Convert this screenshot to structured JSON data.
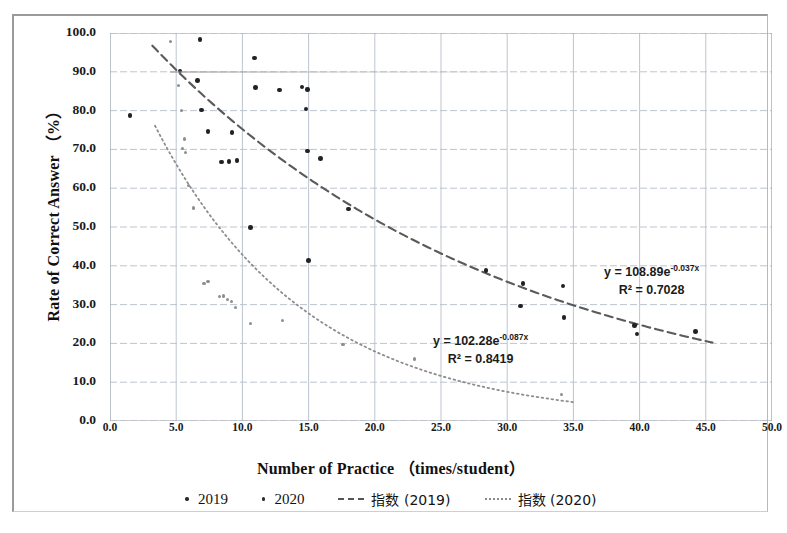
{
  "chart_data": {
    "type": "scatter",
    "title": "",
    "xlabel": "Number of Practice （times/student）",
    "ylabel": "Rate of Correct Answer （%）",
    "xlim": [
      0.0,
      50.0
    ],
    "ylim": [
      0.0,
      100.0
    ],
    "xticks": [
      "0.0",
      "5.0",
      "10.0",
      "15.0",
      "20.0",
      "25.0",
      "30.0",
      "35.0",
      "40.0",
      "45.0",
      "50.0"
    ],
    "yticks": [
      "0.0",
      "10.0",
      "20.0",
      "30.0",
      "40.0",
      "50.0",
      "60.0",
      "70.0",
      "80.0",
      "90.0",
      "100.0"
    ],
    "grid": true,
    "legend_position": "bottom",
    "series": [
      {
        "name": "2019",
        "marker": "small-dot",
        "color": "#222222",
        "points": [
          [
            1.5,
            78.8
          ],
          [
            5.3,
            90.2
          ],
          [
            6.8,
            98.3
          ],
          [
            6.6,
            87.8
          ],
          [
            6.9,
            80.2
          ],
          [
            7.4,
            74.6
          ],
          [
            8.4,
            66.8
          ],
          [
            9.0,
            66.9
          ],
          [
            9.2,
            74.3
          ],
          [
            9.6,
            67.1
          ],
          [
            10.6,
            49.8
          ],
          [
            10.9,
            93.6
          ],
          [
            11.0,
            85.9
          ],
          [
            12.8,
            85.3
          ],
          [
            14.5,
            86.1
          ],
          [
            14.9,
            85.5
          ],
          [
            14.8,
            80.4
          ],
          [
            14.9,
            69.6
          ],
          [
            15.0,
            41.4
          ],
          [
            15.9,
            67.6
          ],
          [
            18.0,
            54.6
          ],
          [
            28.4,
            38.8
          ],
          [
            31.2,
            35.4
          ],
          [
            31.0,
            29.6
          ],
          [
            34.2,
            34.8
          ],
          [
            34.3,
            26.6
          ],
          [
            39.6,
            24.6
          ],
          [
            39.8,
            22.4
          ],
          [
            44.2,
            23.0
          ]
        ]
      },
      {
        "name": "2020",
        "marker": "tiny-dot",
        "color": "#8e8e8e",
        "points": [
          [
            4.6,
            97.8
          ],
          [
            5.2,
            86.4
          ],
          [
            5.4,
            80.1
          ],
          [
            5.6,
            72.7
          ],
          [
            5.5,
            70.2
          ],
          [
            5.7,
            69.3
          ],
          [
            5.9,
            60.8
          ],
          [
            6.3,
            54.9
          ],
          [
            7.1,
            35.5
          ],
          [
            7.4,
            35.9
          ],
          [
            8.3,
            32.1
          ],
          [
            8.6,
            32.2
          ],
          [
            8.9,
            31.4
          ],
          [
            9.2,
            30.7
          ],
          [
            9.5,
            29.3
          ],
          [
            10.6,
            25.2
          ],
          [
            13.0,
            25.8
          ],
          [
            17.6,
            19.8
          ],
          [
            23.0,
            16.0
          ],
          [
            34.1,
            6.8
          ]
        ]
      }
    ],
    "trendlines": [
      {
        "name": "指数 (2019)",
        "style": "dashed",
        "color": "#5a5a5a",
        "equation": "y = 108.89e",
        "exponent": "-0.037x",
        "r2_label": "R² = 0.7028",
        "a": 108.89,
        "b": -0.037,
        "r2": 0.7028,
        "x_start": 3.2,
        "x_end": 45.5
      },
      {
        "name": "指数 (2020)",
        "style": "dotted",
        "color": "#8d8d8d",
        "equation": "y = 102.28e",
        "exponent": "-0.087x",
        "r2_label": "R² = 0.8419",
        "a": 102.28,
        "b": -0.087,
        "r2": 0.8419,
        "x_start": 3.4,
        "x_end": 35.0
      }
    ],
    "legend": [
      {
        "label": "2019",
        "marker": "dot"
      },
      {
        "label": "2020",
        "marker": "dot"
      },
      {
        "label": "指数 (2019)",
        "marker": "dashed-line"
      },
      {
        "label": "指数 (2020)",
        "marker": "dotted-line"
      }
    ]
  }
}
